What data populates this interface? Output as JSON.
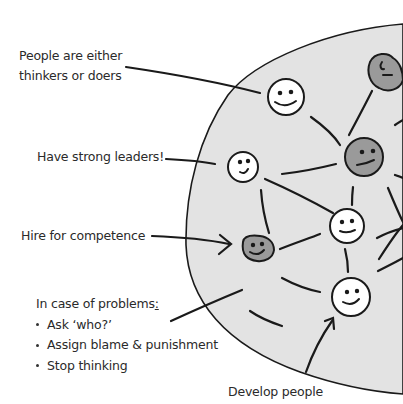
{
  "diagram": {
    "type": "hand-drawn organization network",
    "colors": {
      "blob_fill": "#e3e3e3",
      "stroke": "#1a1a1a",
      "face_white": "#ffffff",
      "face_gray": "#9a9a9a",
      "text": "#2a2a2a"
    },
    "labels": {
      "thinkers_doers_line1": "People are either",
      "thinkers_doers_line2": "thinkers or doers",
      "strong_leaders": "Have strong leaders!",
      "hire": "Hire for competence",
      "problems_heading": "In case of problems",
      "problems_colon": ":",
      "problems_items": [
        "Ask ‘who?’",
        "Assign blame & punishment",
        "Stop thinking"
      ],
      "develop": "Develop people"
    },
    "nodes": [
      {
        "id": "face-1",
        "style": "white",
        "expression": "smile"
      },
      {
        "id": "face-2",
        "style": "gray",
        "expression": "neutral"
      },
      {
        "id": "face-3",
        "style": "white",
        "expression": "smile"
      },
      {
        "id": "face-4",
        "style": "gray",
        "expression": "smirk"
      },
      {
        "id": "face-5",
        "style": "gray",
        "expression": "smile"
      },
      {
        "id": "face-6",
        "style": "white",
        "expression": "smile"
      },
      {
        "id": "face-7",
        "style": "white",
        "expression": "smile"
      }
    ]
  }
}
